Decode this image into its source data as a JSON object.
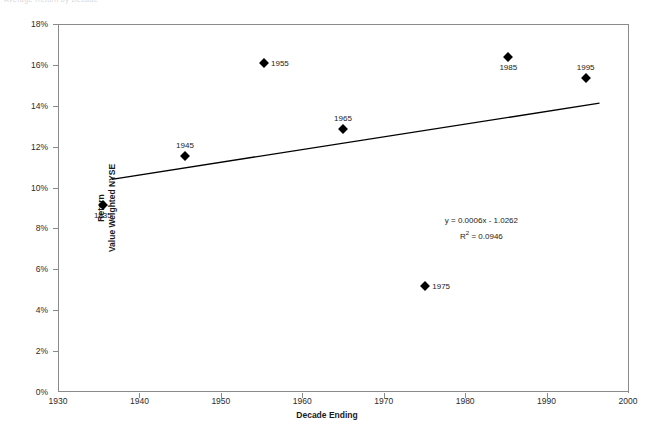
{
  "top_sliver_text": "Average Return by Decade",
  "chart_data": {
    "type": "scatter",
    "title": "",
    "xlabel": "Decade Ending",
    "ylabel_line1": "Return",
    "ylabel_line2": "Value Weighted NYSE",
    "xlim": [
      1930,
      2000
    ],
    "ylim": [
      0,
      18
    ],
    "xticks": [
      "1930",
      "1940",
      "1950",
      "1960",
      "1970",
      "1980",
      "1990",
      "2000"
    ],
    "xtick_values": [
      1930,
      1940,
      1950,
      1960,
      1970,
      1980,
      1990,
      2000
    ],
    "yticks": [
      "0%",
      "2%",
      "4%",
      "6%",
      "8%",
      "10%",
      "12%",
      "14%",
      "16%",
      "18%"
    ],
    "ytick_values": [
      0,
      2,
      4,
      6,
      8,
      10,
      12,
      14,
      16,
      18
    ],
    "grid": false,
    "legend": "none",
    "marker_shape": "diamond",
    "marker_color": "#000000",
    "points": [
      {
        "label": "1935",
        "x": 1935.5,
        "y": 9.15,
        "label_pos": "below"
      },
      {
        "label": "1945",
        "x": 1945.6,
        "y": 11.55,
        "label_pos": "above"
      },
      {
        "label": "1955",
        "x": 1955.3,
        "y": 16.1,
        "label_pos": "right"
      },
      {
        "label": "1965",
        "x": 1965.0,
        "y": 12.85,
        "label_pos": "above"
      },
      {
        "label": "1975",
        "x": 1975.1,
        "y": 5.2,
        "label_pos": "right"
      },
      {
        "label": "1985",
        "x": 1985.3,
        "y": 16.4,
        "label_pos": "below"
      },
      {
        "label": "1995",
        "x": 1994.8,
        "y": 15.35,
        "label_pos": "above"
      }
    ],
    "trendline": {
      "x_start": 1936.6,
      "y_start": 10.4,
      "x_end": 1996.5,
      "y_end": 14.13,
      "color": "#000000"
    },
    "annotations": {
      "equation": "y = 0.0006x - 1.0262",
      "r_squared_prefix": "R",
      "r_squared_sup": "2",
      "r_squared_value": " = 0.0946",
      "x": 1982.0,
      "y": 8.15
    }
  }
}
